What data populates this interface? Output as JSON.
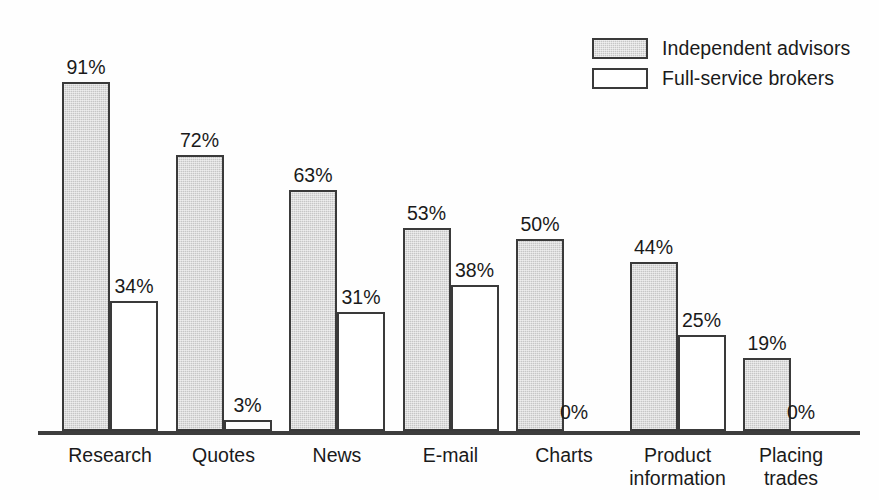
{
  "chart_data": {
    "type": "bar",
    "title": "",
    "subtitle": "",
    "xlabel": "",
    "ylabel": "",
    "ylim": [
      0,
      100
    ],
    "grid": false,
    "legend_position": "top-right",
    "value_suffix": "%",
    "categories": [
      "Research",
      "Quotes",
      "News",
      "E-mail",
      "Charts",
      "Product\ninformation",
      "Placing\ntrades"
    ],
    "series": [
      {
        "name": "Independent advisors",
        "style": "shaded",
        "color": "#c6c6c6",
        "values": [
          91,
          72,
          63,
          53,
          50,
          44,
          19
        ],
        "labels": [
          "91%",
          "72%",
          "63%",
          "53%",
          "50%",
          "44%",
          "19%"
        ]
      },
      {
        "name": "Full-service brokers",
        "style": "open",
        "color": "#ffffff",
        "values": [
          34,
          3,
          31,
          38,
          0,
          25,
          0
        ],
        "labels": [
          "34%",
          "3%",
          "31%",
          "38%",
          "0%",
          "25%",
          "0%"
        ]
      }
    ]
  },
  "legend": {
    "items": [
      {
        "label": "Independent advisors",
        "style": "shaded"
      },
      {
        "label": "Full-service brokers",
        "style": "open"
      }
    ]
  },
  "colors": {
    "shaded_fill": "#c6c6c6",
    "open_fill": "#ffffff",
    "outline": "#3a3a3a",
    "axis": "#3d3d3d",
    "text": "#1a1a1a"
  }
}
